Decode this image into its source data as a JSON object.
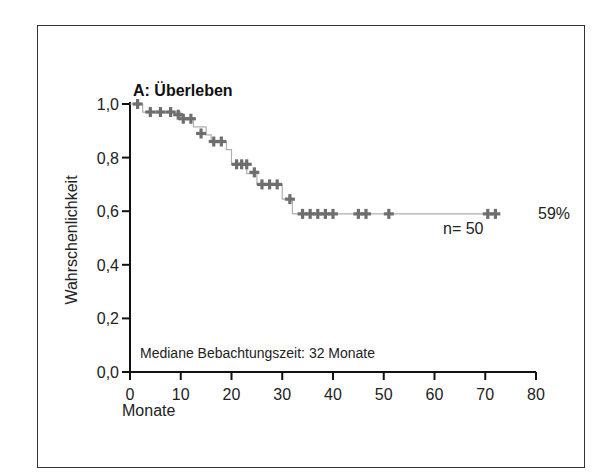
{
  "chart_data": {
    "type": "line",
    "subtype": "kaplan-meier-step",
    "title": "A: Überleben",
    "xlabel": "Monate",
    "ylabel": "Wahrschenlichkeit",
    "xlim": [
      0,
      80
    ],
    "ylim": [
      0,
      1.0
    ],
    "xticks": [
      "0",
      "10",
      "20",
      "30",
      "40",
      "50",
      "60",
      "70",
      "80"
    ],
    "yticks": [
      "0,0",
      "0,2",
      "0,4",
      "0,6",
      "0,8",
      "1,0"
    ],
    "grid": false,
    "steps": [
      {
        "x": 0,
        "y": 1.0
      },
      {
        "x": 2,
        "y": 1.0
      },
      {
        "x": 2.5,
        "y": 0.97
      },
      {
        "x": 10,
        "y": 0.97
      },
      {
        "x": 10,
        "y": 0.945
      },
      {
        "x": 12.5,
        "y": 0.945
      },
      {
        "x": 12.5,
        "y": 0.915
      },
      {
        "x": 15,
        "y": 0.915
      },
      {
        "x": 15,
        "y": 0.885
      },
      {
        "x": 16,
        "y": 0.885
      },
      {
        "x": 16,
        "y": 0.86
      },
      {
        "x": 19,
        "y": 0.86
      },
      {
        "x": 19,
        "y": 0.83
      },
      {
        "x": 20,
        "y": 0.83
      },
      {
        "x": 20,
        "y": 0.775
      },
      {
        "x": 23,
        "y": 0.775
      },
      {
        "x": 23,
        "y": 0.74
      },
      {
        "x": 25,
        "y": 0.74
      },
      {
        "x": 25,
        "y": 0.7
      },
      {
        "x": 30,
        "y": 0.7
      },
      {
        "x": 30,
        "y": 0.645
      },
      {
        "x": 32,
        "y": 0.645
      },
      {
        "x": 32,
        "y": 0.59
      },
      {
        "x": 72,
        "y": 0.59
      }
    ],
    "censored": [
      {
        "x": 1.5,
        "y": 1.0
      },
      {
        "x": 4,
        "y": 0.97
      },
      {
        "x": 6,
        "y": 0.97
      },
      {
        "x": 8,
        "y": 0.97
      },
      {
        "x": 9.5,
        "y": 0.96
      },
      {
        "x": 10.5,
        "y": 0.945
      },
      {
        "x": 12,
        "y": 0.945
      },
      {
        "x": 14,
        "y": 0.89
      },
      {
        "x": 16.5,
        "y": 0.86
      },
      {
        "x": 18,
        "y": 0.86
      },
      {
        "x": 21,
        "y": 0.775
      },
      {
        "x": 22,
        "y": 0.775
      },
      {
        "x": 23,
        "y": 0.775
      },
      {
        "x": 24.5,
        "y": 0.745
      },
      {
        "x": 26,
        "y": 0.7
      },
      {
        "x": 27.5,
        "y": 0.7
      },
      {
        "x": 29,
        "y": 0.7
      },
      {
        "x": 31.5,
        "y": 0.645
      },
      {
        "x": 34,
        "y": 0.59
      },
      {
        "x": 35.5,
        "y": 0.59
      },
      {
        "x": 37,
        "y": 0.59
      },
      {
        "x": 38.5,
        "y": 0.59
      },
      {
        "x": 40,
        "y": 0.59
      },
      {
        "x": 45,
        "y": 0.59
      },
      {
        "x": 46.5,
        "y": 0.59
      },
      {
        "x": 51,
        "y": 0.59
      },
      {
        "x": 70.5,
        "y": 0.59
      },
      {
        "x": 72,
        "y": 0.59
      }
    ],
    "annotations": [
      {
        "text": "59%",
        "x": 73,
        "y": 0.59
      },
      {
        "text": "n= 50",
        "x": 62,
        "y": 0.54
      },
      {
        "text": "Mediane Bebachtungszeit: 32 Monate",
        "x": 1.5,
        "y": 0.07
      }
    ],
    "colors": {
      "curve": "#b0b0b0",
      "marker": "#6e6e6e",
      "axis": "#111111"
    }
  }
}
